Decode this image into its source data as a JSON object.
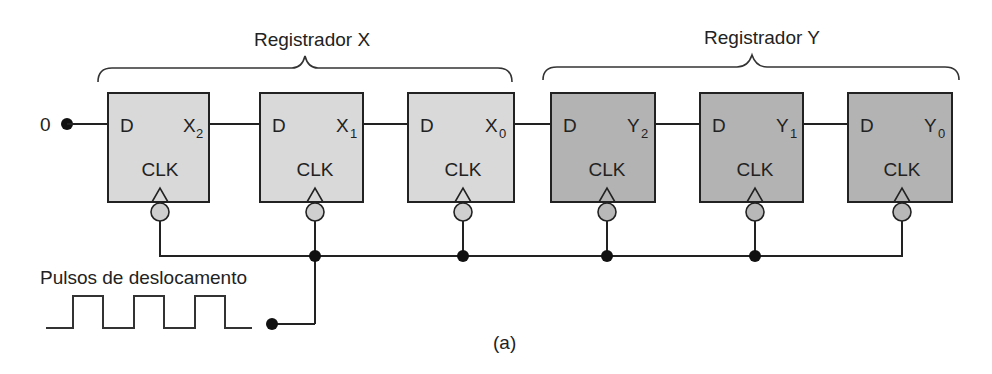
{
  "diagram": {
    "caption": "(a)",
    "input_value": "0",
    "clock_label": "Pulsos de deslocamento",
    "registers": [
      {
        "label": "Registrador X",
        "fill": "#d9d9d9"
      },
      {
        "label": "Registrador Y",
        "fill": "#b3b3b3"
      }
    ],
    "flipflops": [
      {
        "d": "D",
        "q": "X",
        "sub": "2",
        "clk": "CLK"
      },
      {
        "d": "D",
        "q": "X",
        "sub": "1",
        "clk": "CLK"
      },
      {
        "d": "D",
        "q": "X",
        "sub": "0",
        "clk": "CLK"
      },
      {
        "d": "D",
        "q": "Y",
        "sub": "2",
        "clk": "CLK"
      },
      {
        "d": "D",
        "q": "Y",
        "sub": "1",
        "clk": "CLK"
      },
      {
        "d": "D",
        "q": "Y",
        "sub": "0",
        "clk": "CLK"
      }
    ]
  }
}
